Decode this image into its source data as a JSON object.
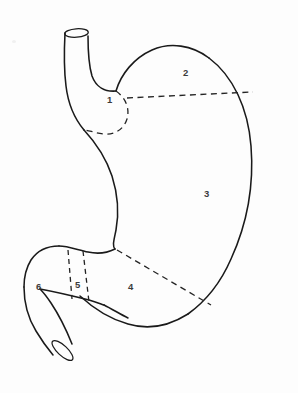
{
  "figure": {
    "background_color": "#ffffff",
    "line_color": "#1a1a1a",
    "dashed_line_color": "#242424",
    "label_color": "#3b3b3b"
  },
  "regions": [
    {
      "id": "region-1",
      "label": "1",
      "name": "cardia",
      "x": 107,
      "y": 95
    },
    {
      "id": "region-2",
      "label": "2",
      "name": "fundus",
      "x": 183,
      "y": 68
    },
    {
      "id": "region-3",
      "label": "3",
      "name": "body",
      "x": 204,
      "y": 189
    },
    {
      "id": "region-4",
      "label": "4",
      "name": "antrum",
      "x": 128,
      "y": 282
    },
    {
      "id": "region-5",
      "label": "5",
      "name": "pylorus",
      "x": 75,
      "y": 280
    },
    {
      "id": "region-6",
      "label": "6",
      "name": "duodenum",
      "x": 36,
      "y": 282
    }
  ],
  "boundaries": [
    {
      "id": "cardia-arc",
      "style": "dashed",
      "separates": "1 / 2 and 3"
    },
    {
      "id": "fundus-line",
      "style": "dashed",
      "separates": "2 / 3"
    },
    {
      "id": "body-antrum-line",
      "style": "dashed",
      "separates": "3 / 4"
    },
    {
      "id": "pylorus-left-line",
      "style": "dashed",
      "separates": "6 / 5"
    },
    {
      "id": "pylorus-right-line",
      "style": "dashed",
      "separates": "5 / 4"
    }
  ],
  "structures": [
    {
      "id": "esophagus",
      "name": "esophagus-tube"
    },
    {
      "id": "stomach-body",
      "name": "stomach-outline"
    },
    {
      "id": "duodenum",
      "name": "duodenum-tube"
    },
    {
      "id": "esophagus-opening",
      "name": "esophagus-lumen-ellipse"
    },
    {
      "id": "duodenum-opening",
      "name": "duodenum-lumen-ellipse"
    }
  ]
}
